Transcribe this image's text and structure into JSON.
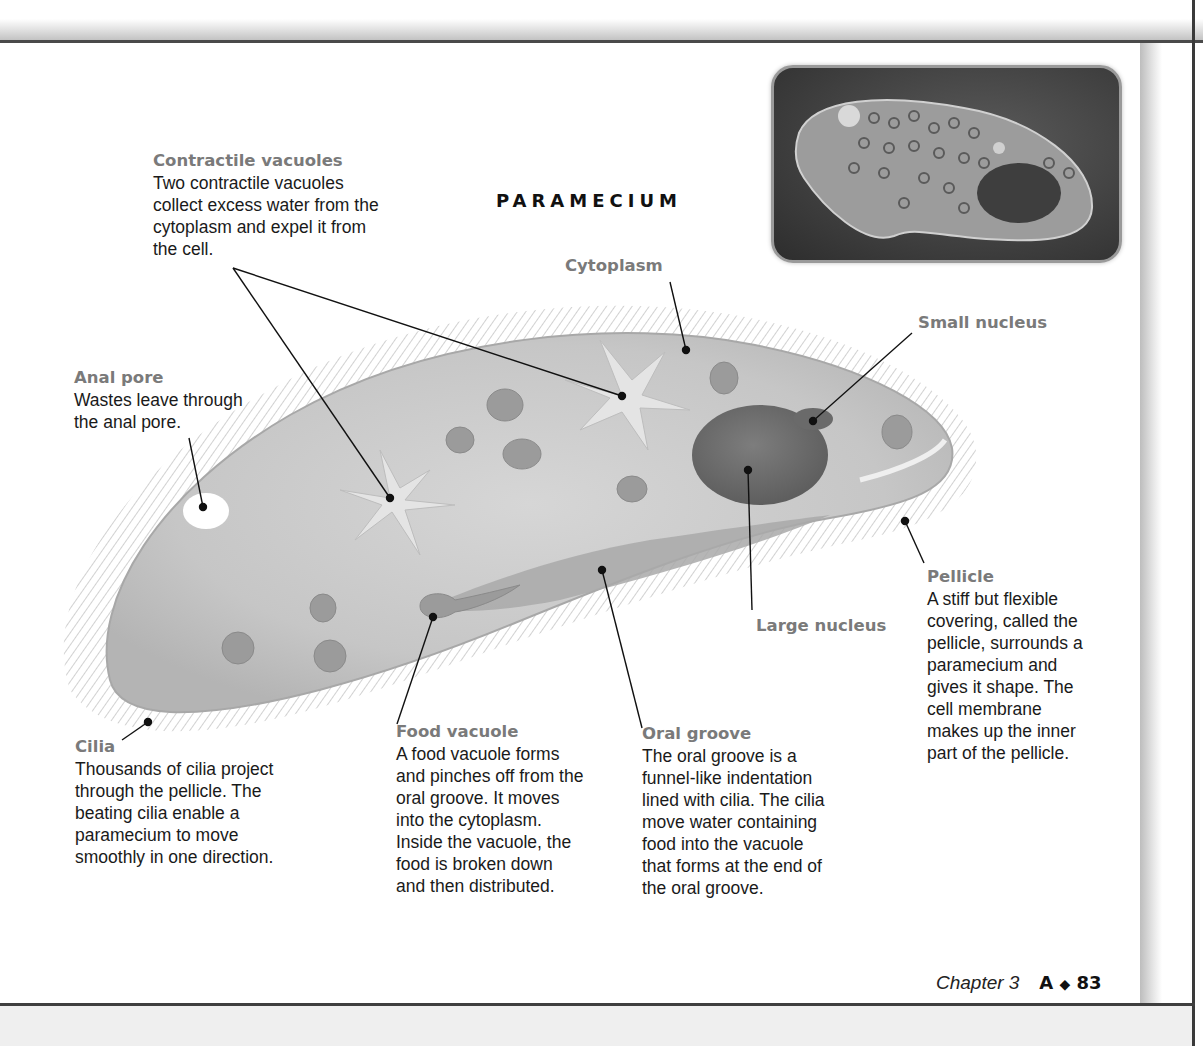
{
  "title": "PARAMECIUM",
  "labels": {
    "contractile_vacuoles": {
      "title": "Contractile vacuoles",
      "lines": [
        "Two contractile vacuoles",
        "collect excess water from the",
        "cytoplasm and expel it from",
        "the cell."
      ]
    },
    "cytoplasm": {
      "title": "Cytoplasm"
    },
    "small_nucleus": {
      "title": "Small nucleus"
    },
    "anal_pore": {
      "title": "Anal pore",
      "lines": [
        "Wastes leave through",
        "the anal pore."
      ]
    },
    "large_nucleus": {
      "title": "Large nucleus"
    },
    "pellicle": {
      "title": "Pellicle",
      "lines": [
        "A stiff but flexible",
        "covering, called the",
        "pellicle, surrounds a",
        "paramecium and",
        "gives it shape. The",
        "cell membrane",
        "makes up the inner",
        "part of the pellicle."
      ]
    },
    "cilia": {
      "title": "Cilia",
      "lines": [
        "Thousands of cilia project",
        "through the pellicle. The",
        "beating cilia enable a",
        "paramecium to move",
        "smoothly in one direction."
      ]
    },
    "food_vacuole": {
      "title": "Food vacuole",
      "lines": [
        "A food vacuole forms",
        "and pinches off from the",
        "oral groove. It moves",
        "into the cytoplasm.",
        "Inside the vacuole, the",
        "food is broken down",
        "and then distributed."
      ]
    },
    "oral_groove": {
      "title": "Oral groove",
      "lines": [
        "The oral groove is a",
        "funnel-like indentation",
        "lined with cilia. The cilia",
        "move water containing",
        "food into the vacuole",
        "that forms at the end of",
        "the oral groove."
      ]
    }
  },
  "photo": {
    "subject": "micrograph of paramecium"
  },
  "footer": {
    "chapter": "Chapter 3",
    "section": "A",
    "separator": "◆",
    "page": "83"
  },
  "colors": {
    "label_gray": "#7a7a7a",
    "text": "#1a1a1a",
    "cell_fill": "#c9c9c9",
    "nucleus": "#6e6e6e"
  }
}
